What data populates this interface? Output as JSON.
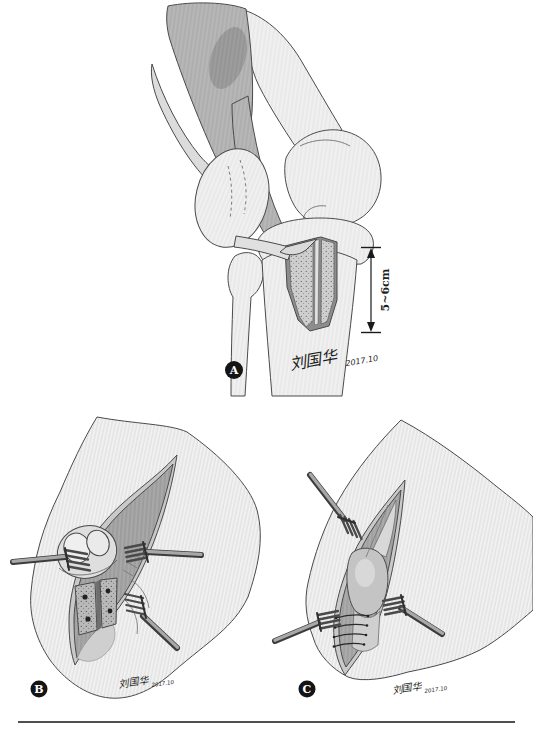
{
  "figure": {
    "panels": [
      {
        "label": "A",
        "measurement_label": "5~6cm",
        "signature_name": "刘国华",
        "signature_date": "2017.10"
      },
      {
        "label": "B",
        "signature_name": "刘国华",
        "signature_date": "2017.10"
      },
      {
        "label": "C",
        "signature_name": "刘国华",
        "signature_date": "2017.10"
      }
    ],
    "colors": {
      "page_bg": "#ffffff",
      "badge_bg": "#141414",
      "badge_text": "#ffffff",
      "ink": "#1e1e1e",
      "divider": "#4f4f4f"
    }
  }
}
